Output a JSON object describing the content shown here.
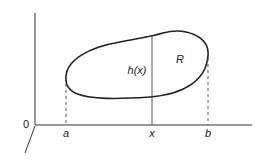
{
  "diagram": {
    "type": "region-between-curves",
    "colors": {
      "ink": "#222222",
      "background": "#ffffff"
    },
    "labels": {
      "origin": "0",
      "a": "a",
      "x": "x",
      "b": "b",
      "height": "h(x)",
      "region": "R"
    }
  }
}
